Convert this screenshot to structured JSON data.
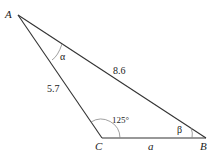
{
  "diagram": {
    "type": "triangle",
    "vertices": {
      "A": {
        "label": "A"
      },
      "B": {
        "label": "B"
      },
      "C": {
        "label": "C"
      }
    },
    "sides": {
      "AB": "8.6",
      "AC": "5.7",
      "CB": "a"
    },
    "angles": {
      "A": "α",
      "B": "β",
      "C": "125°"
    },
    "colors": {
      "stroke": "#333333",
      "arc": "#888888"
    }
  }
}
